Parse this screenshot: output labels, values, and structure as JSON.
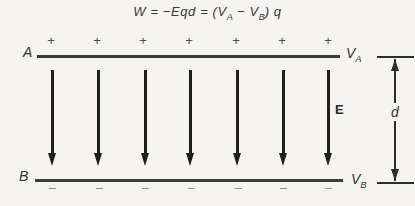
{
  "title_formula": {
    "p1": "W = −Eqd = (V",
    "sub_a": "A",
    "p2": " − V",
    "sub_b": "B",
    "p3": ") q"
  },
  "top_plate": {
    "label": "A",
    "potential": {
      "base": "V",
      "sub": "A"
    },
    "charges": [
      "+",
      "+",
      "+",
      "+",
      "+",
      "+",
      "+"
    ]
  },
  "bottom_plate": {
    "label": "B",
    "potential": {
      "base": "V",
      "sub": "B"
    },
    "charges": [
      "−",
      "−",
      "−",
      "−",
      "−",
      "−",
      "−"
    ]
  },
  "field": {
    "label": "E",
    "arrow_count": 7,
    "direction": "down"
  },
  "dimension": {
    "label": "d"
  },
  "colors": {
    "background": "#f5f4f1",
    "ink": "#2b2b2b",
    "plate": "#3d3d3b"
  }
}
